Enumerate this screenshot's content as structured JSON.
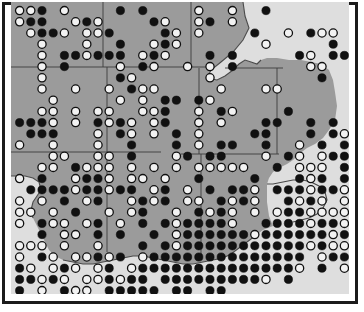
{
  "figure": {
    "domain_type": "map",
    "border_color": "#1b1b1b",
    "paper_color": "#ffffff"
  },
  "map": {
    "land_color": "#9b9b9b",
    "water_color": "#dedede",
    "background_color": "#dedede",
    "boundary_color": "#3c3c3c",
    "coast_color": "#4a4a4a",
    "width": 338,
    "height": 292,
    "grid_pitch": 11.2,
    "dot_radius": 4.1,
    "origin_x": 3.0,
    "origin_y": 3.0
  },
  "legend_symbols": [
    {
      "name": "filled-circle",
      "fill": "#111111",
      "meaning": "filled marker"
    },
    {
      "name": "open-circle",
      "fill": "#f2f2f2",
      "meaning": "open marker"
    }
  ],
  "chart_data": {
    "type": "scatter",
    "title": "",
    "xlabel": "",
    "ylabel": "",
    "marker_categories": [
      "filled",
      "open"
    ],
    "grid_columns": 30,
    "grid_rows": 26,
    "note": "Each row string encodes one grid row: '.'=no dot, 'F'=filled dot, 'O'=open dot",
    "rows": [
      "OOF.O....F.F....O..O..F.......",
      "OFF..OFO....FO..OF.O..........",
      ".OFFO.OOF....FO.O....F..O.FOO.",
      "..O...O..F..OFO.......O.....F.",
      "..O.FFOFFF.OFO...F.F.....FO.FF",
      "..O.F....O.FO..O.O.F......OO..",
      "..O......FO......O.........F..",
      "..O..O..O.FOO.....O...OO......",
      "...O.....O.O.FF.FO............",
      "..OO.O.OO..OOF..O.FO....F.....",
      "FFFO.O.FOFO.OF..O.O...FF..F.F.",
      ".FFF...O.FO.O.F.O....FF...F.FO",
      "O..O...O..F...F.O.FF..F..O.F.F",
      "...OO..OO.F...OF.FF...O.FO.OFF",
      "..OO.FOOO.O.O.O.OOOOO..F.OOO.F",
      "O.F..OFFO.OO.O..F....F...FOF.F",
      ".FFFFOFFOFF.OF.O.F.FFO.FFFOFFO",
      "O.O.F.OF..OFOF.OO.FOFO..FOFO.O",
      "OO.O.F..O.OF..O.FOFO.O.OFFOOOO",
      "O.FOO.OF.O.F.FOFFFFO..FFFFOFFO",
      "..F.OO.F.F..F.OFFFFFFOFFFFFFOF",
      "OOO.O..O...F.FOFFFFFFFFFFFOFOO",
      "O.FO.OOFOF.OFFFFFFFFFFFFFF.OFF",
      "FO.OFO.OF.OFFFFFFFFFFFFFFO.F.O",
      "FFOFO.OOFOFF.FFFFFFFFFO.F.....",
      "F.O.FOO.FFFFF.FF.FF..........."
    ]
  }
}
